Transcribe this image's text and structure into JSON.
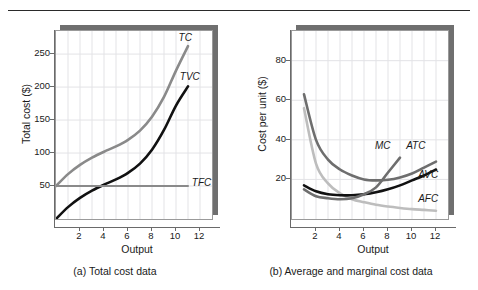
{
  "figure": {
    "panels": [
      {
        "id": "total-cost",
        "caption": "(a) Total cost data",
        "xlabel": "Output",
        "ylabel": "Total cost ($)"
      },
      {
        "id": "average-marginal-cost",
        "caption": "(b) Average and marginal cost data",
        "xlabel": "Output",
        "ylabel": "Cost per unit ($)"
      }
    ],
    "colors": {
      "black": "#111111",
      "dark_gray": "#6e6e6e",
      "mid_gray": "#8a8a8a",
      "light_gray": "#bdbdbd",
      "grid": "#e3e3e6",
      "axis": "#6a6a6a",
      "shadow": "#6f6f6f"
    }
  },
  "chart_data": [
    {
      "type": "line",
      "title": "(a) Total cost data",
      "xlabel": "Output",
      "ylabel": "Total cost ($)",
      "xlim": [
        0,
        13
      ],
      "ylim": [
        0,
        285
      ],
      "xticks": [
        2,
        4,
        6,
        8,
        10,
        12
      ],
      "yticks": [
        50,
        100,
        150,
        200,
        250
      ],
      "grid": true,
      "legend": "inline-curve-labels",
      "x": [
        0,
        1,
        2,
        3,
        4,
        5,
        6,
        7,
        8,
        9,
        10,
        11
      ],
      "series": [
        {
          "name": "TC",
          "label": "TC",
          "color": "#8a8a8a",
          "values": [
            50,
            68,
            82,
            93,
            102,
            110,
            120,
            134,
            155,
            185,
            225,
            262
          ]
        },
        {
          "name": "TVC",
          "label": "TVC",
          "color": "#111111",
          "values": [
            0,
            18,
            32,
            43,
            52,
            60,
            70,
            84,
            105,
            135,
            172,
            201
          ]
        },
        {
          "name": "TFC",
          "label": "TFC",
          "color": "#8a8a8a",
          "values": [
            50,
            50,
            50,
            50,
            50,
            50,
            50,
            50,
            50,
            50,
            50,
            50
          ]
        }
      ],
      "curve_labels": [
        {
          "text": "TC",
          "x": 10.3,
          "y": 272
        },
        {
          "text": "TVC",
          "x": 10.4,
          "y": 212
        },
        {
          "text": "TFC",
          "x": 11.4,
          "y": 52
        }
      ]
    },
    {
      "type": "line",
      "title": "(b) Average and marginal cost data",
      "xlabel": "Output",
      "ylabel": "Cost per unit ($)",
      "xlim": [
        0,
        13
      ],
      "ylim": [
        0,
        95
      ],
      "xticks": [
        2,
        4,
        6,
        8,
        10,
        12
      ],
      "yticks": [
        20,
        40,
        60,
        80
      ],
      "grid": true,
      "legend": "inline-curve-labels",
      "x": [
        1,
        2,
        3,
        4,
        5,
        6,
        7,
        8,
        9,
        10,
        11,
        12
      ],
      "series": [
        {
          "name": "ATC",
          "label": "ATC",
          "color": "#6e6e6e",
          "values": [
            63,
            40,
            30,
            25,
            22,
            20,
            19.5,
            19.8,
            21,
            23,
            26,
            29
          ]
        },
        {
          "name": "AFC",
          "label": "AFC",
          "color": "#bdbdbd",
          "values": [
            56,
            28,
            18,
            13,
            10,
            8.5,
            7.2,
            6.3,
            5.6,
            5,
            4.6,
            4.2
          ]
        },
        {
          "name": "AVC",
          "label": "AVC",
          "color": "#111111",
          "values": [
            17,
            14,
            12.5,
            12,
            12,
            12.5,
            13.5,
            15,
            17,
            19.5,
            22,
            25
          ]
        },
        {
          "name": "MC",
          "label": "MC",
          "color": "#6e6e6e",
          "values": [
            15,
            11.5,
            10.5,
            10,
            10.5,
            12.5,
            16,
            23.5,
            31,
            null,
            null,
            null
          ]
        }
      ],
      "curve_labels": [
        {
          "text": "MC",
          "x": 7.0,
          "y": 36
        },
        {
          "text": "ATC",
          "x": 9.6,
          "y": 36
        },
        {
          "text": "AVC",
          "x": 10.6,
          "y": 21
        },
        {
          "text": "AFC",
          "x": 10.6,
          "y": 9
        }
      ]
    }
  ]
}
